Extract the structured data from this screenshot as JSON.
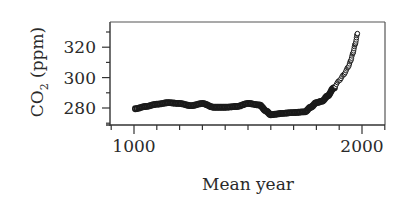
{
  "chart_data": {
    "type": "scatter",
    "title": "",
    "xlabel": "Mean year",
    "ylabel": "CO2 (ppm)",
    "ylabel_main": "CO",
    "ylabel_sub": "2",
    "ylabel_unit": " (ppm)",
    "xlim": [
      900,
      2100
    ],
    "ylim": [
      270,
      335
    ],
    "x_ticks_labeled": [
      1000,
      2000
    ],
    "x_tick_labels": [
      "1000",
      "2000"
    ],
    "x_minor_step": 100,
    "y_ticks_labeled": [
      280,
      300,
      320
    ],
    "y_tick_labels": [
      "280",
      "300",
      "320"
    ],
    "y_minor_step": 10,
    "grid": false,
    "legend": null,
    "series": [
      {
        "name": "CO2 concentration",
        "marker": "open-circle",
        "x": [
          1006,
          1050,
          1100,
          1150,
          1200,
          1250,
          1300,
          1350,
          1400,
          1450,
          1500,
          1550,
          1580,
          1600,
          1625,
          1650,
          1700,
          1750,
          1775,
          1800,
          1825,
          1850,
          1875,
          1900,
          1920,
          1940,
          1950,
          1960,
          1970,
          1980
        ],
        "y": [
          279.5,
          281,
          282.5,
          283.5,
          283,
          281.5,
          283,
          280.5,
          280.5,
          281,
          283,
          282,
          278,
          275.5,
          276,
          276.5,
          277,
          277.5,
          280.5,
          283.5,
          284.5,
          288,
          293,
          298,
          302,
          307,
          311,
          316,
          322,
          329
        ]
      }
    ]
  }
}
